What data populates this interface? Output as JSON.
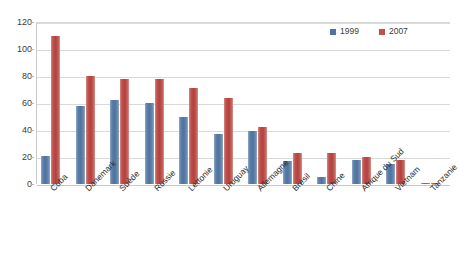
{
  "chart_data": {
    "type": "bar",
    "title": "",
    "subtitle": "",
    "xlabel": "",
    "ylabel": "",
    "ylim": [
      0,
      120
    ],
    "yticks": [
      0,
      20,
      40,
      60,
      80,
      100,
      120
    ],
    "grid": true,
    "legend_position": "top-right",
    "categories": [
      "Cuba",
      "Danemark",
      "Suède",
      "Russie",
      "Lettonie",
      "Uruguay",
      "Allemagne",
      "Brésil",
      "Chine",
      "Afrique du Sud",
      "Vietnam",
      "Tanzanie"
    ],
    "series": [
      {
        "name": "1999",
        "color": "#4f739e",
        "values": [
          21,
          58,
          62,
          60,
          50,
          37,
          39,
          17,
          5,
          18,
          15,
          0.5
        ]
      },
      {
        "name": "2007",
        "color": "#c0504d",
        "values": [
          110,
          80,
          78,
          78,
          71,
          64,
          42,
          23,
          23,
          20,
          18,
          1
        ]
      }
    ]
  },
  "legend": {
    "entries": [
      {
        "label": "1999",
        "color": "#4f739e"
      },
      {
        "label": "2007",
        "color": "#c0504d"
      }
    ]
  },
  "colors": {
    "series_1999": "#4f739e",
    "series_2007": "#c0504d",
    "gridline": "#d9d9d9",
    "axis": "#c9c9c9",
    "background": "#ffffff",
    "text": "#3c3c3c"
  }
}
